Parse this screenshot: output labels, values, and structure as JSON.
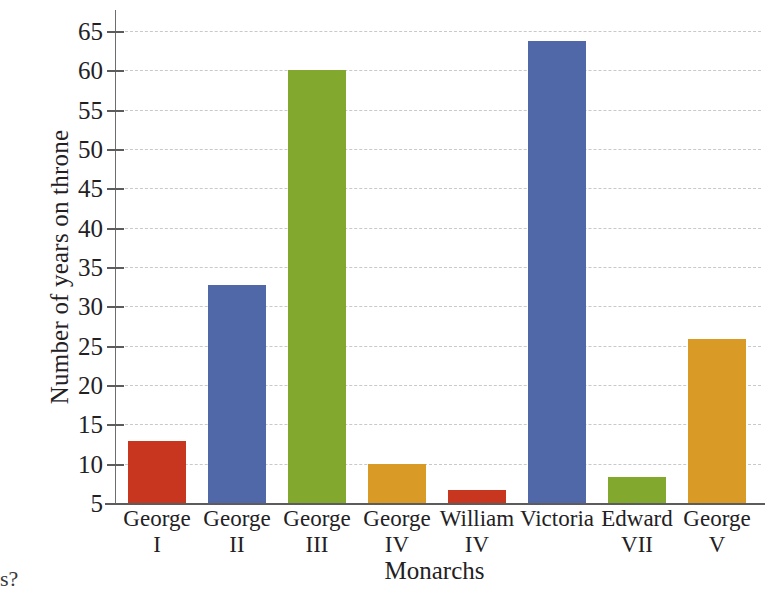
{
  "chart_data": {
    "type": "bar",
    "title": "",
    "xlabel": "Monarchs",
    "ylabel": "Number of years on throne",
    "categories": [
      "George I",
      "George II",
      "George III",
      "George IV",
      "William IV",
      "Victoria",
      "Edward VII",
      "George V"
    ],
    "category_lines": [
      [
        "George",
        "I"
      ],
      [
        "George",
        "II"
      ],
      [
        "George",
        "III"
      ],
      [
        "George",
        "IV"
      ],
      [
        "William",
        "IV"
      ],
      [
        "Victoria",
        ""
      ],
      [
        "Edward",
        "VII"
      ],
      [
        "George",
        "V"
      ]
    ],
    "values": [
      12.9,
      32.7,
      60.0,
      9.9,
      6.7,
      63.7,
      8.3,
      25.8
    ],
    "bar_colors": [
      "#c8361f",
      "#5168a8",
      "#83a82e",
      "#da9b26",
      "#c8361f",
      "#5168a8",
      "#83a82e",
      "#da9b26"
    ],
    "ylim": [
      5,
      65
    ],
    "yticks": [
      5,
      10,
      15,
      20,
      25,
      30,
      35,
      40,
      45,
      50,
      55,
      60,
      65
    ],
    "ytick_labels": [
      "5",
      "10",
      "15",
      "20",
      "25",
      "30",
      "35",
      "40",
      "45",
      "50",
      "55",
      "60",
      "65"
    ],
    "grid": true,
    "grid_style": "dashed",
    "grid_color": "#c9c9c9",
    "legend": "none",
    "axis_color": "#5c5c5c",
    "background": "#ffffff"
  },
  "artifact": {
    "bottom_left_text": "s?"
  }
}
